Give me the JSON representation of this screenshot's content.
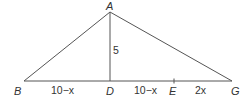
{
  "diagram": {
    "type": "triangle-with-altitude",
    "points": {
      "A": {
        "label": "A",
        "x": 110,
        "y": 12
      },
      "B": {
        "label": "B",
        "x": 24,
        "y": 81
      },
      "D": {
        "label": "D",
        "x": 110,
        "y": 81
      },
      "E": {
        "label": "E",
        "x": 174,
        "y": 81
      },
      "G": {
        "label": "G",
        "x": 232,
        "y": 81
      }
    },
    "segments": [
      {
        "from": "A",
        "to": "B"
      },
      {
        "from": "A",
        "to": "G"
      },
      {
        "from": "A",
        "to": "D"
      },
      {
        "from": "B",
        "to": "G"
      }
    ],
    "tick_marks": [
      "E"
    ],
    "lengths": {
      "AD": "5",
      "BD": "10−x",
      "DE": "10−x",
      "EG": "2x"
    }
  }
}
